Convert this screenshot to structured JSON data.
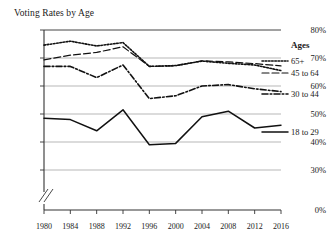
{
  "chart_data": {
    "type": "line",
    "title": "Voting Rates by Age",
    "xlabel": "",
    "ylabel": "",
    "grid": true,
    "legend_position": "right",
    "legend_title": "Ages",
    "x": [
      1980,
      1984,
      1988,
      1992,
      1996,
      2000,
      2004,
      2008,
      2012,
      2016
    ],
    "xtick_labels": [
      "1980",
      "1984",
      "1988",
      "1992",
      "1996",
      "2000",
      "2004",
      "2008",
      "2012",
      "2016"
    ],
    "ytick_labels": [
      "80%",
      "70%",
      "60%",
      "50%",
      "40%",
      "30%",
      "0%"
    ],
    "ytick_values": [
      80,
      70,
      60,
      50,
      40,
      30,
      0
    ],
    "ylim": [
      30,
      80
    ],
    "axis_break": true,
    "axis_break_label": "0%",
    "series": [
      {
        "name": "65+",
        "style": "dotted",
        "values": [
          74.6,
          76.0,
          74.3,
          75.5,
          67.0,
          67.3,
          68.9,
          68.1,
          67.5,
          65.5
        ]
      },
      {
        "name": "45 to 64",
        "style": "dashed",
        "values": [
          69.3,
          71.0,
          72.0,
          74.0,
          67.0,
          67.2,
          69.0,
          68.6,
          68.0,
          67.2
        ]
      },
      {
        "name": "30 to 44",
        "style": "dashdot",
        "values": [
          67.0,
          67.0,
          63.0,
          67.5,
          55.5,
          56.5,
          60.0,
          60.5,
          59.0,
          58.0
        ]
      },
      {
        "name": "18 to 29",
        "style": "solid",
        "values": [
          48.5,
          48.0,
          44.0,
          51.5,
          39.0,
          39.5,
          49.0,
          51.0,
          45.0,
          46.0
        ]
      }
    ]
  },
  "plot": {
    "left": 44,
    "right": 281,
    "top": 30,
    "bottom": 210,
    "y_top_value": 80,
    "y_bottom_value": 26,
    "break_y": 196
  }
}
